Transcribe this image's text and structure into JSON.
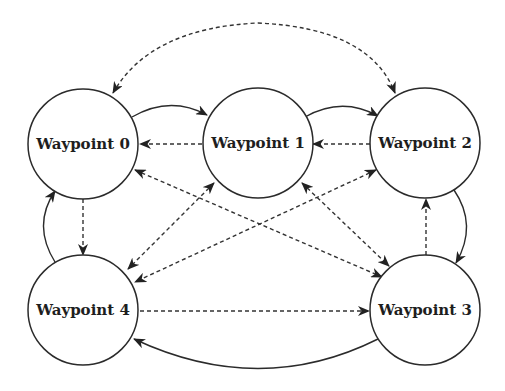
{
  "diagram": {
    "type": "directed-graph",
    "colors": {
      "stroke": "#2b2b2b",
      "text": "#1e1e1e",
      "background": "#ffffff"
    },
    "nodes": [
      {
        "id": 0,
        "label": "Waypoint 0",
        "cx": 83,
        "cy": 144,
        "r": 55
      },
      {
        "id": 1,
        "label": "Waypoint 1",
        "cx": 258,
        "cy": 143,
        "r": 55
      },
      {
        "id": 2,
        "label": "Waypoint 2",
        "cx": 425,
        "cy": 143,
        "r": 55
      },
      {
        "id": 3,
        "label": "Waypoint 3",
        "cx": 425,
        "cy": 310,
        "r": 55
      },
      {
        "id": 4,
        "label": "Waypoint 4",
        "cx": 83,
        "cy": 310,
        "r": 55
      }
    ],
    "edges": [
      {
        "from": 0,
        "to": 1,
        "style": "solid",
        "shape": "arc"
      },
      {
        "from": 1,
        "to": 0,
        "style": "dashed",
        "shape": "straight"
      },
      {
        "from": 1,
        "to": 2,
        "style": "solid",
        "shape": "arc"
      },
      {
        "from": 2,
        "to": 1,
        "style": "dashed",
        "shape": "straight"
      },
      {
        "from": 0,
        "to": 2,
        "style": "dashed",
        "shape": "arc",
        "bidirectional": true
      },
      {
        "from": 2,
        "to": 3,
        "style": "solid",
        "shape": "arc"
      },
      {
        "from": 3,
        "to": 2,
        "style": "dashed",
        "shape": "straight"
      },
      {
        "from": 3,
        "to": 4,
        "style": "solid",
        "shape": "arc"
      },
      {
        "from": 4,
        "to": 3,
        "style": "dashed",
        "shape": "straight"
      },
      {
        "from": 4,
        "to": 0,
        "style": "solid",
        "shape": "arc"
      },
      {
        "from": 0,
        "to": 4,
        "style": "dashed",
        "shape": "straight"
      },
      {
        "from": 0,
        "to": 3,
        "style": "dashed",
        "shape": "straight",
        "bidirectional": true
      },
      {
        "from": 1,
        "to": 4,
        "style": "dashed",
        "shape": "straight",
        "bidirectional": true
      },
      {
        "from": 1,
        "to": 3,
        "style": "dashed",
        "shape": "straight",
        "bidirectional": true
      },
      {
        "from": 2,
        "to": 4,
        "style": "dashed",
        "shape": "straight",
        "bidirectional": true
      }
    ]
  }
}
